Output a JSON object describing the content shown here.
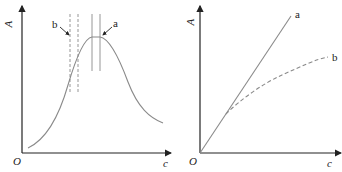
{
  "left_panel": {
    "y_axis_label": "A",
    "x_axis_label": "c",
    "origin_label": "O",
    "annotation_a": "a",
    "annotation_b": "b",
    "curve": "bell-shaped absorbance vs concentration, solid gray",
    "band_a": "solid vertical lines at peak",
    "band_b": "dashed vertical lines on rising slope"
  },
  "right_panel": {
    "y_axis_label": "A",
    "x_axis_label": "c",
    "origin_label": "O",
    "line_a_label": "a",
    "line_b_label": "b",
    "line_a": "straight solid line through origin",
    "line_b": "dashed curve deviating downward"
  },
  "colors": {
    "axis": "#222222",
    "curve": "#8a8a8a"
  }
}
